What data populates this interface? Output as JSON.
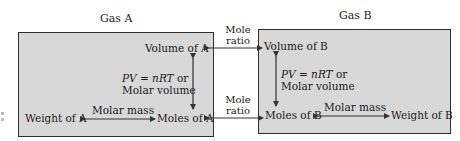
{
  "gas_a": {
    "title": "Gas A",
    "volume": "Volume of A",
    "moles": "Moles of A",
    "weight": "Weight of A",
    "vertical_relation": {
      "line1_italic": "PV = nRT",
      "line1_rest": " or",
      "line2": "Molar volume"
    },
    "horizontal_relation": "Molar mass"
  },
  "gas_b": {
    "title": "Gas B",
    "volume": "Volume of B",
    "moles": "Moles of B",
    "weight": "Weight of B",
    "vertical_relation": {
      "line1_italic": "PV = nRT",
      "line1_rest": " or",
      "line2": "Molar volume"
    },
    "horizontal_relation": "Molar mass"
  },
  "links": {
    "top": {
      "line1": "Mole",
      "line2": "ratio"
    },
    "bottom": {
      "line1": "Mole",
      "line2": "ratio"
    }
  },
  "colors": {
    "box_fill": "#d8d8d8",
    "box_border": "#2e2e2e",
    "arrow": "#333333"
  }
}
